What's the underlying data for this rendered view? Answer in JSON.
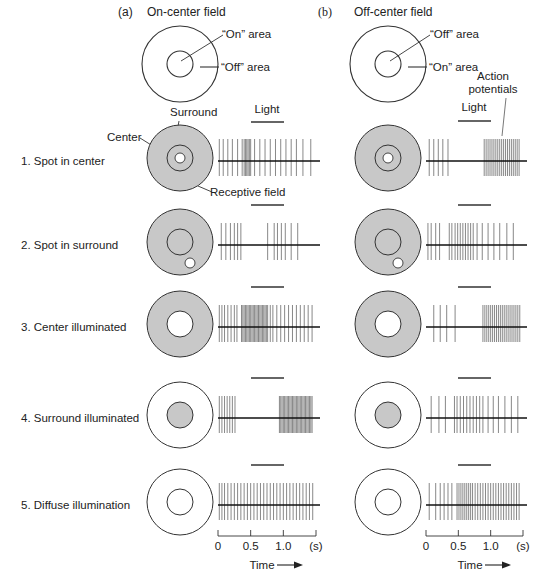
{
  "columns": [
    {
      "panel_letter": "(a)",
      "title": "On-center field",
      "top_labels": {
        "inner": "“On” area",
        "outer": "“Off” area"
      },
      "cx": 239,
      "trace_x0": 218,
      "trace_x1": 320,
      "light_bar": [
        251,
        284
      ]
    },
    {
      "panel_letter": "(b)",
      "title": "Off-center field",
      "top_labels": {
        "inner": "“Off” area",
        "outer": "“On” area"
      },
      "cx": 447,
      "trace_x0": 426,
      "trace_x1": 527,
      "light_bar": [
        458,
        491
      ],
      "extra_label": "Action potentials"
    }
  ],
  "light_label": "Light",
  "annotations": {
    "surround": "Surround",
    "center": "Center",
    "receptive_field": "Receptive field"
  },
  "rows": [
    {
      "label": "1. Spot in center",
      "y": 161,
      "stimulus": "spot-center",
      "spikes_a": [
        0.02,
        0.08,
        0.15,
        0.22,
        0.3,
        0.37,
        0.4,
        0.42,
        0.44,
        0.46,
        0.48,
        0.5,
        0.56,
        0.64,
        0.72,
        0.8,
        0.88,
        0.96,
        1.04,
        1.12,
        1.2,
        1.3,
        1.42
      ],
      "spikes_b": [
        0.05,
        0.12,
        0.19,
        0.26,
        0.34,
        0.9,
        0.93,
        0.96,
        0.99,
        1.02,
        1.05,
        1.08,
        1.11,
        1.14,
        1.17,
        1.2,
        1.23,
        1.26,
        1.29,
        1.32,
        1.35,
        1.38,
        1.41,
        1.44
      ]
    },
    {
      "label": "2. Spot in surround",
      "y": 245,
      "stimulus": "spot-surround",
      "spikes_a": [
        0.05,
        0.12,
        0.19,
        0.25,
        0.3,
        0.35,
        0.76,
        0.86,
        0.91,
        0.97,
        1.03,
        1.12,
        1.22
      ],
      "spikes_b": [
        0.03,
        0.08,
        0.15,
        0.21,
        0.36,
        0.4,
        0.45,
        0.49,
        0.53,
        0.57,
        0.61,
        0.65,
        0.69,
        0.73,
        0.79,
        0.87,
        0.96,
        1.05,
        1.14,
        1.25,
        1.35
      ]
    },
    {
      "label": "3. Center illuminated",
      "y": 327,
      "stimulus": "center-lit",
      "spikes_a": [
        0.02,
        0.06,
        0.1,
        0.15,
        0.2,
        0.25,
        0.29,
        0.36,
        0.38,
        0.4,
        0.42,
        0.44,
        0.46,
        0.48,
        0.5,
        0.52,
        0.54,
        0.56,
        0.58,
        0.6,
        0.62,
        0.64,
        0.66,
        0.68,
        0.7,
        0.72,
        0.74,
        0.76,
        0.8,
        0.84,
        0.9,
        0.96,
        1.02,
        1.08,
        1.14,
        1.2,
        1.26,
        1.32,
        1.38,
        1.44
      ],
      "spikes_b": [
        0.12,
        0.22,
        0.32,
        0.45,
        0.88,
        0.91,
        0.94,
        0.97,
        1.0,
        1.03,
        1.06,
        1.09,
        1.12,
        1.15,
        1.18,
        1.21,
        1.24,
        1.27,
        1.3,
        1.33,
        1.36,
        1.39,
        1.42,
        1.45
      ]
    },
    {
      "label": "4. Surround illuminated",
      "y": 418,
      "stimulus": "surround-lit",
      "spikes_a": [
        0.02,
        0.06,
        0.1,
        0.14,
        0.18,
        0.22,
        0.26,
        0.94,
        0.96,
        0.98,
        1.0,
        1.02,
        1.04,
        1.06,
        1.08,
        1.1,
        1.12,
        1.14,
        1.16,
        1.18,
        1.2,
        1.22,
        1.24,
        1.26,
        1.28,
        1.3,
        1.32,
        1.34,
        1.36,
        1.38,
        1.4,
        1.42,
        1.44
      ],
      "spikes_b": [
        0.08,
        0.2,
        0.3,
        0.44,
        0.48,
        0.53,
        0.58,
        0.63,
        0.68,
        0.73,
        0.78,
        0.83,
        0.88,
        0.96,
        1.04,
        1.12,
        1.22,
        1.32,
        1.42
      ]
    },
    {
      "label": "5. Diffuse illumination",
      "y": 505,
      "stimulus": "diffuse",
      "spikes_a": [
        0.02,
        0.06,
        0.1,
        0.15,
        0.2,
        0.25,
        0.3,
        0.35,
        0.4,
        0.45,
        0.5,
        0.55,
        0.6,
        0.65,
        0.7,
        0.75,
        0.8,
        0.85,
        0.9,
        0.95,
        1.0,
        1.05,
        1.1,
        1.15,
        1.2,
        1.25,
        1.3,
        1.35,
        1.4,
        1.45
      ],
      "spikes_b": [
        0.05,
        0.15,
        0.22,
        0.28,
        0.34,
        0.4,
        0.48,
        0.51,
        0.54,
        0.57,
        0.6,
        0.63,
        0.66,
        0.69,
        0.72,
        0.76,
        0.8,
        0.84,
        0.88,
        0.92,
        0.96,
        1.0,
        1.04,
        1.08,
        1.12,
        1.16,
        1.2,
        1.24,
        1.28,
        1.32,
        1.36,
        1.4,
        1.44
      ]
    }
  ],
  "time_axis": {
    "ticks": [
      "0",
      "0.5",
      "1.0"
    ],
    "unit": "(s)",
    "label": "Time",
    "max_s": 1.5
  },
  "colors": {
    "surround_fill": "#c8c8c8",
    "stroke": "#333333",
    "spike": "#555555",
    "baseline": "#111111",
    "background": "#ffffff"
  }
}
